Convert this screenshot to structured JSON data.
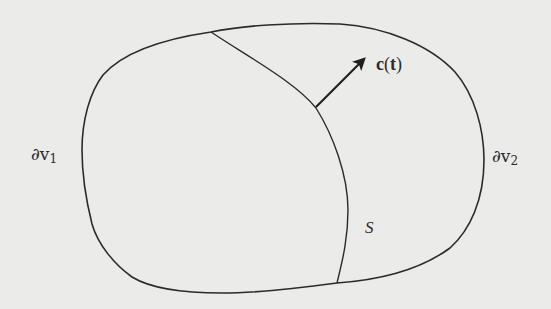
{
  "figure": {
    "type": "schematic",
    "colors": {
      "background": "#ebebea",
      "stroke": "#2b2b2b"
    }
  },
  "labels": {
    "boundary_left": {
      "symbol": "∂v",
      "subscript": "1"
    },
    "boundary_right": {
      "symbol": "∂v",
      "subscript": "2"
    },
    "surface": "S",
    "vector": {
      "name": "c",
      "open": "(",
      "arg": "t",
      "close": ")"
    }
  },
  "elements": {
    "outer_boundary": "closed-curve",
    "interior_surface": "curve",
    "normal_vector": "arrow"
  }
}
